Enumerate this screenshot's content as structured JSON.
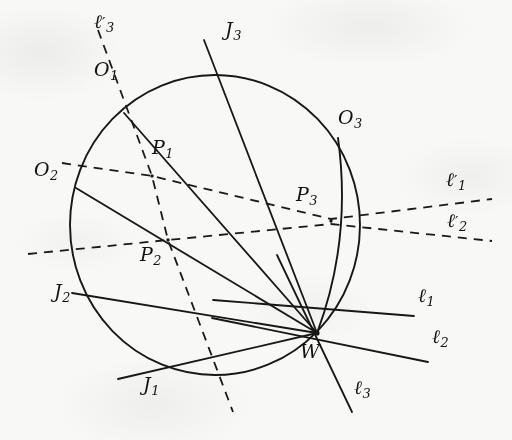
{
  "figure": {
    "type": "geometry-diagram",
    "background_color": "#f8f8f7",
    "ink_color": "#141414",
    "circle": {
      "cx": 215,
      "cy": 225,
      "r": 145
    },
    "points": [
      {
        "name": "O1",
        "label": "O",
        "sub": "1",
        "x": 124,
        "y": 113,
        "label_x": 96,
        "label_y": 68
      },
      {
        "name": "O2",
        "label": "O",
        "sub": "2",
        "x": 76,
        "y": 188,
        "label_x": 38,
        "label_y": 168
      },
      {
        "name": "O3",
        "label": "O",
        "sub": "3",
        "x": 338,
        "y": 138,
        "label_x": 340,
        "label_y": 115
      },
      {
        "name": "P1",
        "label": "P",
        "sub": "1",
        "x": 152,
        "y": 176,
        "label_x": 153,
        "label_y": 146
      },
      {
        "name": "P2",
        "label": "P",
        "sub": "2",
        "x": 168,
        "y": 240,
        "label_x": 144,
        "label_y": 250
      },
      {
        "name": "P3",
        "label": "P",
        "sub": "3",
        "x": 331,
        "y": 221,
        "label_x": 299,
        "label_y": 190
      },
      {
        "name": "J1",
        "label": "J",
        "sub": "1",
        "x": 180,
        "y": 368,
        "label_x": 146,
        "label_y": 383
      },
      {
        "name": "J2",
        "label": "J",
        "sub": "2",
        "x": 95,
        "y": 300,
        "label_x": 56,
        "label_y": 288
      },
      {
        "name": "J3",
        "label": "J",
        "sub": "3",
        "x": 222,
        "y": 82,
        "label_x": 228,
        "label_y": 24
      },
      {
        "name": "W",
        "label": "W",
        "sub": "",
        "x": 317,
        "y": 333,
        "label_x": 303,
        "label_y": 348
      }
    ],
    "line_labels": [
      {
        "name": "l1",
        "label": "ℓ",
        "sub": "1",
        "prime": false,
        "x": 420,
        "y": 292
      },
      {
        "name": "l2",
        "label": "ℓ",
        "sub": "2",
        "prime": false,
        "x": 434,
        "y": 332
      },
      {
        "name": "l3",
        "label": "ℓ",
        "sub": "3",
        "prime": false,
        "x": 356,
        "y": 383
      },
      {
        "name": "l1-prime",
        "label": "ℓ",
        "sub": "1",
        "prime": true,
        "x": 448,
        "y": 175
      },
      {
        "name": "l2-prime",
        "label": "ℓ",
        "sub": "2",
        "prime": true,
        "x": 449,
        "y": 216
      },
      {
        "name": "l3-prime",
        "label": "ℓ",
        "sub": "3",
        "prime": true,
        "x": 96,
        "y": 16
      }
    ],
    "solid_segments": [
      {
        "name": "chord-O1-W",
        "x1": 124,
        "y1": 113,
        "x2": 317,
        "y2": 333
      },
      {
        "name": "chord-O2-W",
        "x1": 76,
        "y1": 188,
        "x2": 317,
        "y2": 333
      },
      {
        "name": "chord-O3-W",
        "x1": 338,
        "y1": 138,
        "x2": 317,
        "y2": 333
      },
      {
        "name": "line-l1-through-W",
        "x1": 247,
        "y1": 306,
        "x2": 415,
        "y2": 318
      },
      {
        "name": "line-l2-through-W",
        "x1": 244,
        "y1": 327,
        "x2": 430,
        "y2": 360
      },
      {
        "name": "line-l3-through-W",
        "x1": 276,
        "y1": 272,
        "x2": 353,
        "y2": 413
      },
      {
        "name": "secant-J1-W",
        "x1": 121,
        "y1": 378,
        "x2": 317,
        "y2": 333
      },
      {
        "name": "secant-J2-W",
        "x1": 72,
        "y1": 293,
        "x2": 317,
        "y2": 333
      },
      {
        "name": "secant-J3-W",
        "x1": 205,
        "y1": 42,
        "x2": 317,
        "y2": 333
      }
    ],
    "dashed_segments": [
      {
        "name": "line-l1-prime",
        "x1": 62,
        "y1": 165,
        "x2": 492,
        "y2": 200
      },
      {
        "name": "line-l2-prime",
        "x1": 30,
        "y1": 250,
        "x2": 492,
        "y2": 240
      },
      {
        "name": "line-l3-prime",
        "x1": 97,
        "y1": 28,
        "x2": 233,
        "y2": 412
      }
    ]
  }
}
